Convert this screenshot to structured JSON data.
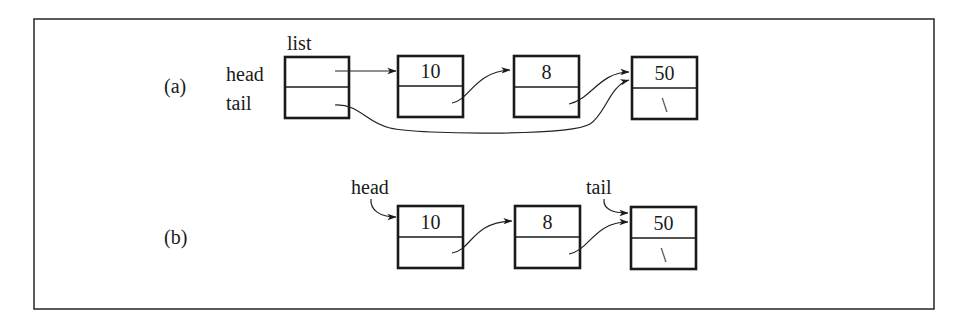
{
  "figure": {
    "panels": [
      {
        "id": "a",
        "label": "(a)",
        "list_box": {
          "title": "list",
          "fields": [
            "head",
            "tail"
          ]
        },
        "nodes": [
          {
            "value": "10",
            "next": ""
          },
          {
            "value": "8",
            "next": ""
          },
          {
            "value": "50",
            "next": "\\"
          }
        ],
        "pointers": [
          "list.head -> node 10",
          "node 10.next -> node 8",
          "node 8.next -> node 50",
          "list.tail -> node 50"
        ]
      },
      {
        "id": "b",
        "label": "(b)",
        "head_label": "head",
        "tail_label": "tail",
        "nodes": [
          {
            "value": "10",
            "next": ""
          },
          {
            "value": "8",
            "next": ""
          },
          {
            "value": "50",
            "next": "\\"
          }
        ],
        "pointers": [
          "head -> node 10",
          "node 10.next -> node 8",
          "node 8.next -> node 50",
          "tail -> node 50"
        ]
      }
    ]
  },
  "colors": {
    "ink": "#1a1a1a",
    "frame": "#333333",
    "background": "#ffffff"
  }
}
